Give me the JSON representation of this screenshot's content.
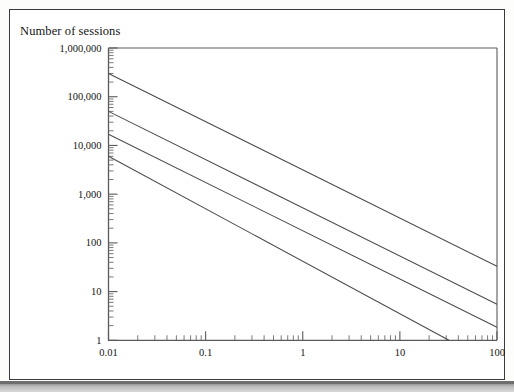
{
  "figure": {
    "frame": true,
    "background": "#ffffff",
    "border_color": "#3a3a3a"
  },
  "chart_data": {
    "type": "line",
    "title": "",
    "ylabel": "Number of sessions",
    "xlabel": "",
    "xscale": "log",
    "yscale": "log",
    "xlim": [
      0.01,
      100
    ],
    "ylim": [
      1,
      1000000
    ],
    "grid": false,
    "legend": null,
    "xtick_labels": [
      "0.01",
      "0.1",
      "1",
      "10",
      "100"
    ],
    "xticks": [
      0.01,
      0.1,
      1,
      10,
      100
    ],
    "ytick_labels": [
      "1,000,000",
      "100,000",
      "10,000",
      "1,000",
      "100",
      "10",
      "1"
    ],
    "yticks": [
      1000000,
      100000,
      10000,
      1000,
      100,
      10,
      1
    ],
    "minor_ticks": true,
    "line_color": "#4a4a4a",
    "series": [
      {
        "name": "line-1",
        "x": [
          0.01,
          100
        ],
        "y": [
          300000,
          33
        ],
        "slope_decades_per_decade": -1.0
      },
      {
        "name": "line-2",
        "x": [
          0.01,
          100
        ],
        "y": [
          50000,
          5.5
        ],
        "slope_decades_per_decade": -1.0
      },
      {
        "name": "line-3",
        "x": [
          0.01,
          100
        ],
        "y": [
          17000,
          1.85
        ],
        "slope_decades_per_decade": -1.0
      },
      {
        "name": "line-4",
        "x": [
          0.01,
          32
        ],
        "y": [
          6000,
          1
        ],
        "slope_decades_per_decade": -1.0
      }
    ]
  },
  "axes": {
    "y_title": "Number of sessions"
  }
}
